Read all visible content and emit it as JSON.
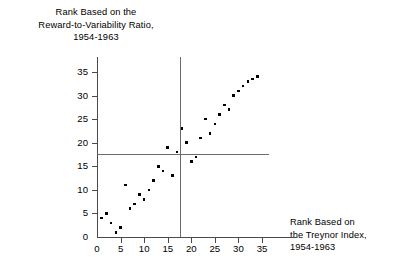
{
  "chart_data": {
    "type": "scatter",
    "title": "",
    "ylabel_lines": [
      "Rank Based on the",
      "Reward-to-Variability Ratio,",
      "1954-1963"
    ],
    "xlabel_lines": [
      "Rank Based on",
      "the Treynor Index,",
      "1954-1963"
    ],
    "xlabel": "Rank Based on the Treynor Index, 1954-1963",
    "ylabel": "Rank Based on the Reward-to-Variability Ratio, 1954-1963",
    "xlim": [
      0,
      37
    ],
    "ylim": [
      0,
      37
    ],
    "xticks": [
      0,
      5,
      10,
      15,
      20,
      25,
      30,
      35
    ],
    "yticks": [
      0,
      5,
      10,
      15,
      20,
      25,
      30,
      35
    ],
    "xtick_labels": [
      "0",
      "5",
      "10",
      "15",
      "20",
      "25",
      "30",
      "35"
    ],
    "ytick_labels": [
      "0",
      "5",
      "10",
      "15",
      "20",
      "25",
      "30",
      "35"
    ],
    "grid": false,
    "legend": null,
    "reference_lines": [
      {
        "orientation": "vertical",
        "value": 17.5,
        "color": "#6b6b6b"
      },
      {
        "orientation": "horizontal",
        "value": 17.5,
        "color": "#6b6b6b"
      }
    ],
    "marker_color": "#000000",
    "points": [
      {
        "x": 1,
        "y": 4
      },
      {
        "x": 2,
        "y": 5
      },
      {
        "x": 3,
        "y": 3
      },
      {
        "x": 4,
        "y": 1
      },
      {
        "x": 5,
        "y": 2
      },
      {
        "x": 6,
        "y": 11
      },
      {
        "x": 7,
        "y": 6
      },
      {
        "x": 8,
        "y": 7
      },
      {
        "x": 9,
        "y": 9
      },
      {
        "x": 10,
        "y": 8
      },
      {
        "x": 11,
        "y": 10
      },
      {
        "x": 12,
        "y": 12
      },
      {
        "x": 13,
        "y": 15
      },
      {
        "x": 14,
        "y": 14
      },
      {
        "x": 15,
        "y": 19
      },
      {
        "x": 16,
        "y": 13
      },
      {
        "x": 17,
        "y": 18
      },
      {
        "x": 18,
        "y": 23
      },
      {
        "x": 19,
        "y": 20
      },
      {
        "x": 20,
        "y": 16
      },
      {
        "x": 21,
        "y": 17
      },
      {
        "x": 22,
        "y": 21
      },
      {
        "x": 23,
        "y": 25
      },
      {
        "x": 24,
        "y": 22
      },
      {
        "x": 25,
        "y": 24
      },
      {
        "x": 26,
        "y": 26
      },
      {
        "x": 27,
        "y": 28
      },
      {
        "x": 28,
        "y": 27
      },
      {
        "x": 29,
        "y": 30
      },
      {
        "x": 30,
        "y": 31
      },
      {
        "x": 31,
        "y": 32
      },
      {
        "x": 32,
        "y": 33
      },
      {
        "x": 33,
        "y": 33.5
      },
      {
        "x": 34,
        "y": 34
      }
    ]
  }
}
